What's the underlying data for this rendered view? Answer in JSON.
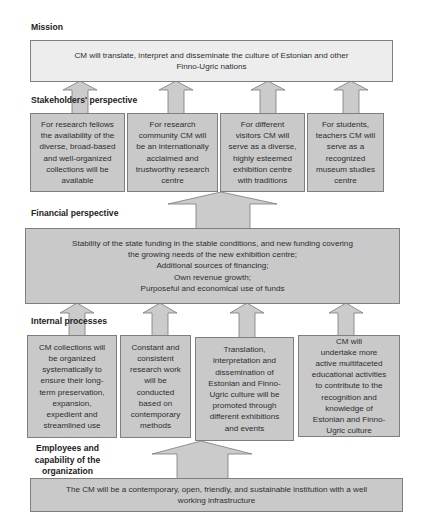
{
  "mission": {
    "label": "Mission",
    "text": "CM will translate, interpret and disseminate the culture of Estonian and other\nFinno-Ugric nations"
  },
  "stakeholders": {
    "label": "Stakeholders' perspective",
    "boxes": [
      {
        "text": "For research fellows\nthe availability of the\ndiverse, broad-based\nand well-organized\ncollections will be\navailable"
      },
      {
        "text": "For research\ncommunity CM will\nbe an internationally\nacclaimed and\ntrustworthy research\ncentre"
      },
      {
        "text": "For different\nvisitors CM will\nserve as a diverse,\nhighly esteemed\nexhibition centre\nwith traditions"
      },
      {
        "text": "For students,\nteachers CM will\nserve as a\nrecognized\nmuseum studies\ncentre"
      }
    ]
  },
  "financial": {
    "label": "Financial perspective",
    "text": "Stability of the state funding in the stable conditions, and new funding covering\nthe growing needs of the new exhibition centre;\nAdditional sources of financing;\nOwn revenue growth;\nPurposeful and economical use of funds"
  },
  "internal": {
    "label": "Internal processes",
    "boxes": [
      {
        "text": "CM collections will\nbe  organized\nsystematically to\nensure their long-\nterm preservation,\nexpansion,\nexpedient and\nstreamlined use"
      },
      {
        "text": "Constant and\nconsistent\nresearch work\nwill be\nconducted\nbased on\ncontemporary\nmethods"
      },
      {
        "text": "Translation,\ninterpretation and\ndissemination of\nEstonian and Finno-\nUgric culture will be\npromoted through\ndifferent exhibitions\nand events"
      },
      {
        "text": "CM will\nundertake more\nactive multifaceted\neducational activities\nto contribute to the\nrecognition and\nknowledge of\nEstonian and Finno-\nUgric culture"
      }
    ]
  },
  "employees": {
    "label": "Employees and\ncapability of the\norganization",
    "text": "The CM will be a contemporary, open, friendly, and sustainable institution with a well\nworking infrastructure"
  },
  "colors": {
    "box_fill": "#c9c9c9",
    "mission_fill": "#ededed",
    "border": "#7f7f7f"
  }
}
